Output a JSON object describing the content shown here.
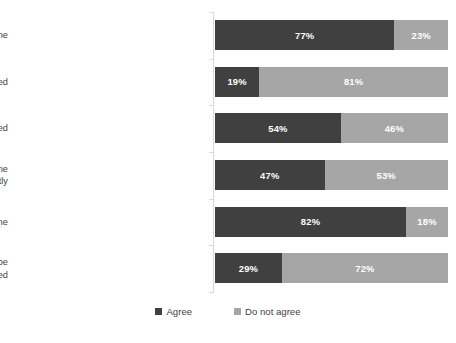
{
  "chart_data": {
    "type": "bar",
    "subtype": "stacked-horizontal-100pct",
    "title": "",
    "subtitle": "",
    "xlabel": "",
    "ylabel": "",
    "grid": false,
    "axis_visible": true,
    "legend_position": "bottom",
    "value_suffix": "%",
    "xlim": [
      0,
      100
    ],
    "categories": [
      "Prison terms in themselves do not reduce crime",
      "Abortion should be banned",
      "The death penalty should be restored",
      "Increased welfare spending would reduce crime significantly",
      "Harsher sentences would deter crime",
      "Mild drugs such as marihuana should be legalized"
    ],
    "series": [
      {
        "name": "Agree",
        "color": "#404040",
        "values": [
          77,
          19,
          54,
          47,
          82,
          29
        ],
        "labels": [
          "77%",
          "19%",
          "54%",
          "47%",
          "82%",
          "29%"
        ]
      },
      {
        "name": "Do not agree",
        "color": "#a6a6a6",
        "values": [
          23,
          81,
          46,
          53,
          18,
          72
        ],
        "labels": [
          "23%",
          "81%",
          "46%",
          "53%",
          "18%",
          "72%"
        ]
      }
    ]
  },
  "legend": {
    "items": [
      {
        "label": "Agree",
        "color": "#404040"
      },
      {
        "label": "Do not agree",
        "color": "#a6a6a6"
      }
    ]
  },
  "colors": {
    "agree": "#404040",
    "do_not_agree": "#a6a6a6",
    "axis": "#d9d9d9",
    "text": "#3f3f3f",
    "value_text": "#ffffff",
    "background": "#ffffff"
  }
}
